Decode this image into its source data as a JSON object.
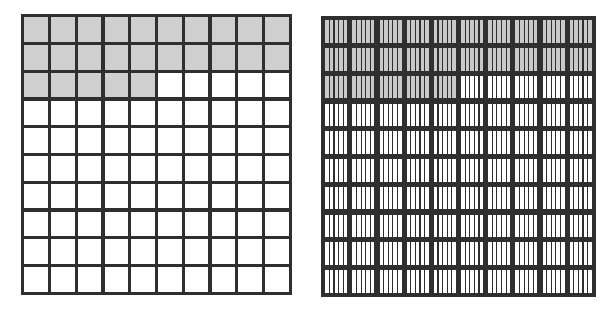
{
  "figure": {
    "background_color": "#ffffff",
    "grid_line_color": "#2f2f2f",
    "shaded_color": "#cfcfcf",
    "unshaded_color": "#ffffff"
  },
  "grids": [
    {
      "name": "hundredths-grid",
      "label": "Hundredths grid",
      "rows": 10,
      "columns": 10,
      "subdivisions_per_cell": 1,
      "total_parts": 100,
      "shaded_parts": 25,
      "shaded_fraction": "25/100",
      "shaded_decimal": "0.25",
      "row_shaded_counts": [
        10,
        10,
        5,
        0,
        0,
        0,
        0,
        0,
        0,
        0
      ]
    },
    {
      "name": "thousandths-grid",
      "label": "Thousandths grid",
      "rows": 10,
      "columns": 10,
      "subdivisions_per_cell": 5,
      "total_parts": 500,
      "shaded_parts": 125,
      "shaded_fraction": "125/500",
      "shaded_decimal": "0.25",
      "row_shaded_counts": [
        10,
        10,
        5,
        0,
        0,
        0,
        0,
        0,
        0,
        0
      ]
    }
  ],
  "chart_data": {
    "type": "heatmap",
    "xlabel": "",
    "ylabel": "",
    "grid": true,
    "legend_position": "none",
    "panels": [
      {
        "name": "hundredths-grid",
        "rows": 10,
        "columns": 10,
        "subdivisions_per_cell": 1,
        "values": [
          [
            1,
            1,
            1,
            1,
            1,
            1,
            1,
            1,
            1,
            1
          ],
          [
            1,
            1,
            1,
            1,
            1,
            1,
            1,
            1,
            1,
            1
          ],
          [
            1,
            1,
            1,
            1,
            1,
            0,
            0,
            0,
            0,
            0
          ],
          [
            0,
            0,
            0,
            0,
            0,
            0,
            0,
            0,
            0,
            0
          ],
          [
            0,
            0,
            0,
            0,
            0,
            0,
            0,
            0,
            0,
            0
          ],
          [
            0,
            0,
            0,
            0,
            0,
            0,
            0,
            0,
            0,
            0
          ],
          [
            0,
            0,
            0,
            0,
            0,
            0,
            0,
            0,
            0,
            0
          ],
          [
            0,
            0,
            0,
            0,
            0,
            0,
            0,
            0,
            0,
            0
          ],
          [
            0,
            0,
            0,
            0,
            0,
            0,
            0,
            0,
            0,
            0
          ],
          [
            0,
            0,
            0,
            0,
            0,
            0,
            0,
            0,
            0,
            0
          ]
        ]
      },
      {
        "name": "thousandths-grid",
        "rows": 10,
        "columns": 10,
        "subdivisions_per_cell": 5,
        "values": [
          [
            1,
            1,
            1,
            1,
            1,
            1,
            1,
            1,
            1,
            1
          ],
          [
            1,
            1,
            1,
            1,
            1,
            1,
            1,
            1,
            1,
            1
          ],
          [
            1,
            1,
            1,
            1,
            1,
            0,
            0,
            0,
            0,
            0
          ],
          [
            0,
            0,
            0,
            0,
            0,
            0,
            0,
            0,
            0,
            0
          ],
          [
            0,
            0,
            0,
            0,
            0,
            0,
            0,
            0,
            0,
            0
          ],
          [
            0,
            0,
            0,
            0,
            0,
            0,
            0,
            0,
            0,
            0
          ],
          [
            0,
            0,
            0,
            0,
            0,
            0,
            0,
            0,
            0,
            0
          ],
          [
            0,
            0,
            0,
            0,
            0,
            0,
            0,
            0,
            0,
            0
          ],
          [
            0,
            0,
            0,
            0,
            0,
            0,
            0,
            0,
            0,
            0
          ],
          [
            0,
            0,
            0,
            0,
            0,
            0,
            0,
            0,
            0,
            0
          ]
        ]
      }
    ]
  }
}
